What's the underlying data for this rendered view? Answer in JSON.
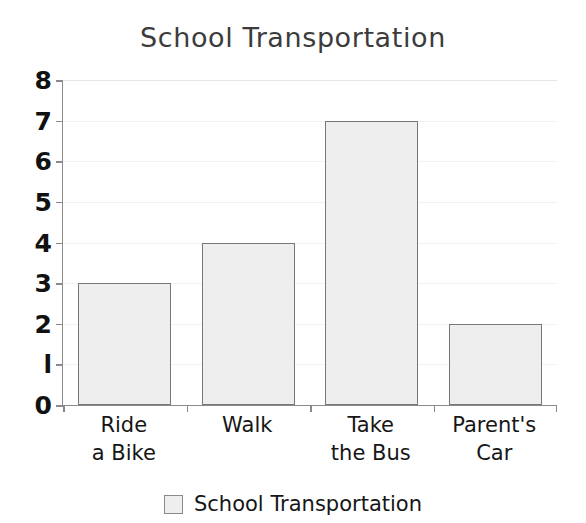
{
  "chart_data": {
    "type": "bar",
    "title": "School Transportation",
    "xlabel": "",
    "ylabel": "",
    "categories": [
      "Ride a Bike",
      "Walk",
      "Take the Bus",
      "Parent's Car"
    ],
    "category_lines": [
      [
        "Ride",
        "a Bike"
      ],
      [
        "Walk"
      ],
      [
        "Take",
        "the Bus"
      ],
      [
        "Parent's",
        "Car"
      ]
    ],
    "values": [
      3,
      4,
      7,
      2
    ],
    "series": [
      {
        "name": "School Transportation",
        "values": [
          3,
          4,
          7,
          2
        ]
      }
    ],
    "ylim": [
      0,
      8
    ],
    "yticks": [
      0,
      1,
      2,
      3,
      4,
      5,
      6,
      7,
      8
    ],
    "ytick_labels": [
      "0",
      "l",
      "2",
      "3",
      "4",
      "5",
      "6",
      "7",
      "8"
    ],
    "grid": true,
    "legend": {
      "position": "bottom",
      "entries": [
        "School Transportation"
      ]
    },
    "colors": {
      "bar_fill": "#eeeeee",
      "bar_edge": "#777777",
      "axis": "#8a8a8a",
      "grid": "#f1f1f1",
      "title_text": "#3c3c3c",
      "label_text": "#161616",
      "background": "#ffffff"
    }
  },
  "legend": {
    "label": "School Transportation",
    "swatch_name": "legend-color-swatch"
  }
}
